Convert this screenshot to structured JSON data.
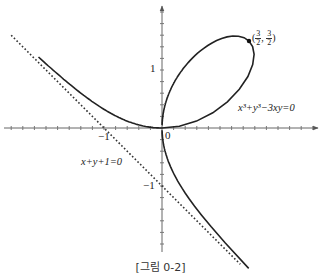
{
  "figure": {
    "caption": "[그림 0-2]",
    "axes": {
      "origin_label": "0",
      "x_tick_label_neg1": "−1",
      "y_tick_label_1": "1",
      "y_tick_label_neg1": "−1",
      "x_range": [
        -2.7,
        2.7
      ],
      "y_range": [
        -2.3,
        2.2
      ]
    },
    "curves": [
      {
        "name": "folium-of-descartes",
        "equation": "x³+y³−3xy=0",
        "style": "solid"
      },
      {
        "name": "asymptote",
        "equation": "x+y+1=0",
        "style": "dotted"
      }
    ],
    "point": {
      "label_open": "(",
      "x_num": "3",
      "x_den": "2",
      "sep": ", ",
      "y_num": "3",
      "y_den": "2",
      "label_close": ")",
      "coords": [
        1.5,
        1.5
      ]
    },
    "labels": {
      "folium_eq": "x³+y³−3xy=0",
      "asymptote_eq": "x+y+1=0"
    },
    "colors": {
      "curve": "#222222",
      "axis": "#555555",
      "background": "#ffffff"
    }
  }
}
